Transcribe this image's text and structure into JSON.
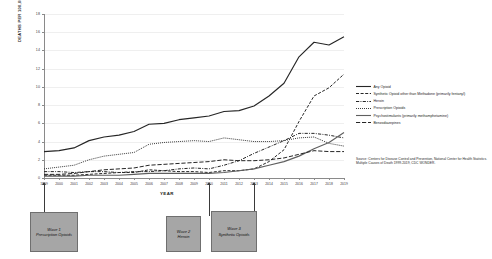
{
  "chart_data": {
    "type": "line",
    "title": "",
    "xlabel": "YEAR",
    "ylabel": "DEATHS PER 100,000 POPULATION",
    "xlim": [
      1999,
      2019
    ],
    "ylim": [
      0,
      18
    ],
    "grid": true,
    "legend_position": "right",
    "categories": [
      1999,
      2000,
      2001,
      2002,
      2003,
      2004,
      2005,
      2006,
      2007,
      2008,
      2009,
      2010,
      2011,
      2012,
      2013,
      2014,
      2015,
      2016,
      2017,
      2018,
      2019
    ],
    "ytick_labels": [
      "18",
      "16",
      "14",
      "12",
      "10",
      "8",
      "6",
      "4",
      "2",
      "0"
    ],
    "ytick_values": [
      18,
      16,
      14,
      12,
      10,
      8,
      6,
      4,
      2,
      0
    ],
    "xtick_labels": [
      "1999",
      "2000",
      "2001",
      "2002",
      "2003",
      "2004",
      "2005",
      "2006",
      "2007",
      "2008",
      "2009",
      "2010",
      "2011",
      "2012",
      "2013",
      "2014",
      "2015",
      "2016",
      "2017",
      "2018",
      "2019"
    ],
    "series": [
      {
        "name": "Any Opioid",
        "style": "solid",
        "color": "#262626",
        "values": [
          2.9,
          3.0,
          3.3,
          4.1,
          4.5,
          4.7,
          5.1,
          5.9,
          6.0,
          6.4,
          6.6,
          6.8,
          7.3,
          7.4,
          7.9,
          9.0,
          10.4,
          13.3,
          14.9,
          14.6,
          15.5
        ]
      },
      {
        "name": "Synthetic Opioid other than Methadone (primarily fentanyl)",
        "style": "dashed",
        "color": "#262626",
        "values": [
          0.3,
          0.3,
          0.3,
          0.4,
          0.5,
          0.6,
          0.6,
          0.9,
          0.8,
          0.7,
          0.7,
          0.6,
          0.8,
          0.8,
          1.0,
          1.8,
          3.1,
          6.2,
          9.0,
          9.9,
          11.4
        ]
      },
      {
        "name": "Heroin",
        "style": "dashdot",
        "color": "#262626",
        "values": [
          0.7,
          0.7,
          0.6,
          0.7,
          0.7,
          0.6,
          0.7,
          0.7,
          0.8,
          1.0,
          1.1,
          1.0,
          1.4,
          1.9,
          2.7,
          3.4,
          4.1,
          4.9,
          4.9,
          4.7,
          4.4
        ]
      },
      {
        "name": "Prescription Opioids",
        "style": "dotted",
        "color": "#262626",
        "values": [
          1.0,
          1.2,
          1.4,
          2.0,
          2.4,
          2.6,
          2.8,
          3.7,
          3.9,
          4.0,
          4.1,
          4.0,
          4.4,
          4.2,
          4.0,
          4.0,
          4.1,
          4.4,
          4.5,
          3.8,
          3.5
        ]
      },
      {
        "name": "Psychostimulants (primarily methamphetamine)",
        "style": "solid",
        "color": "#5f5f5f",
        "values": [
          0.2,
          0.2,
          0.2,
          0.3,
          0.3,
          0.3,
          0.4,
          0.5,
          0.5,
          0.5,
          0.5,
          0.5,
          0.6,
          0.8,
          1.0,
          1.4,
          1.8,
          2.4,
          3.2,
          3.9,
          5.0
        ]
      },
      {
        "name": "Benzodiazepines",
        "style": "longdash",
        "color": "#262626",
        "values": [
          0.4,
          0.4,
          0.5,
          0.7,
          0.9,
          1.0,
          1.1,
          1.4,
          1.5,
          1.6,
          1.7,
          1.8,
          2.0,
          1.9,
          1.9,
          2.0,
          2.2,
          2.6,
          3.0,
          2.9,
          2.9
        ]
      }
    ],
    "annotations": [
      {
        "id": "wave-1",
        "title": "Wave 1",
        "subtitle": "Prescription Opioids",
        "anchor_year": 1999
      },
      {
        "id": "wave-2",
        "title": "Wave 2",
        "subtitle": "Heroin",
        "anchor_year": 2010
      },
      {
        "id": "wave-3",
        "title": "Wave 3",
        "subtitle": "Synthetic Opioids",
        "anchor_year": 2013
      }
    ],
    "source": "Source: Centers for Disease Control and Prevention, National Center for Health Statistics. Multiple Causes of Death 1999-2019, CDC WONDER."
  },
  "legend": {
    "items": [
      {
        "label": "Any Opioid",
        "style": "solid"
      },
      {
        "label": "Synthetic Opioid other than Methadone (primarily fentanyl)",
        "style": "dashed"
      },
      {
        "label": "Heroin",
        "style": "dashdot"
      },
      {
        "label": "Prescription Opioids",
        "style": "dotted"
      },
      {
        "label": "Psychostimulants (primarily methamphetamine)",
        "style": "solid-gray"
      },
      {
        "label": "Benzodiazepines",
        "style": "longdash"
      }
    ]
  },
  "axes": {
    "y_title": "DEATHS PER 100,000 POPULATION",
    "x_title": "YEAR"
  },
  "waves": [
    {
      "title": "Wave 1",
      "subtitle": "Prescription Opioids"
    },
    {
      "title": "Wave 2",
      "subtitle": "Heroin"
    },
    {
      "title": "Wave 3",
      "subtitle": "Synthetic Opioids"
    }
  ],
  "source_note": "Source: Centers for Disease Control and Prevention, National Center for Health Statistics. Multiple Causes of Death 1999-2019, CDC WONDER.",
  "colors": {
    "ink": "#262626",
    "gray_series": "#5f5f5f",
    "grid": "#efefef",
    "axis": "#8a8a8a",
    "wave_box_fill": "#a6a6a6",
    "wave_box_border": "#6f6f6f"
  }
}
